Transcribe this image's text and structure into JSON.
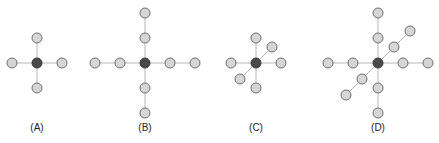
{
  "figure": {
    "colors": {
      "center_node": "#4a4a4a",
      "outer_node": "#d6d6d6",
      "node_outline": "#6e6e6e",
      "edge": "#b8b8b8",
      "background": "#ffffff"
    },
    "panels": [
      {
        "label": "(A)",
        "description": "center node with 4 neighbors at distance 1 (up, down, left, right)",
        "arms": [
          {
            "direction": "up",
            "length": 1
          },
          {
            "direction": "down",
            "length": 1
          },
          {
            "direction": "left",
            "length": 1
          },
          {
            "direction": "right",
            "length": 1
          }
        ]
      },
      {
        "label": "(B)",
        "description": "center node with 4 arms of length 2",
        "arms": [
          {
            "direction": "up",
            "length": 2
          },
          {
            "direction": "down",
            "length": 2
          },
          {
            "direction": "left",
            "length": 2
          },
          {
            "direction": "right",
            "length": 2
          }
        ]
      },
      {
        "label": "(C)",
        "description": "center node with 6 neighbors at distance 1 including a diagonal axis",
        "arms": [
          {
            "direction": "up",
            "length": 1
          },
          {
            "direction": "down",
            "length": 1
          },
          {
            "direction": "left",
            "length": 1
          },
          {
            "direction": "right",
            "length": 1
          },
          {
            "direction": "diag-up-right",
            "length": 1
          },
          {
            "direction": "diag-down-left",
            "length": 1
          }
        ]
      },
      {
        "label": "(D)",
        "description": "center node with 6 arms of length 2 including a diagonal axis",
        "arms": [
          {
            "direction": "up",
            "length": 2
          },
          {
            "direction": "down",
            "length": 2
          },
          {
            "direction": "left",
            "length": 2
          },
          {
            "direction": "right",
            "length": 2
          },
          {
            "direction": "diag-up-right",
            "length": 2
          },
          {
            "direction": "diag-down-left",
            "length": 2
          }
        ]
      }
    ]
  }
}
